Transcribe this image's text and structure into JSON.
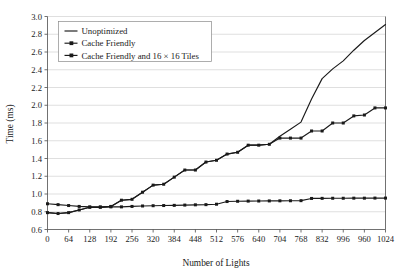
{
  "chart_data": {
    "type": "line",
    "title": "",
    "xlabel": "Number of Lights",
    "ylabel": "Time (ms)",
    "xlim": [
      0,
      1024
    ],
    "ylim": [
      0.6,
      3.0
    ],
    "grid": "horizontal",
    "legend_position": "top-left",
    "y_ticks": [
      "0.6",
      "0.8",
      "1.0",
      "1.2",
      "1.4",
      "1.6",
      "1.8",
      "2.0",
      "2.2",
      "2.4",
      "2.6",
      "2.8",
      "3.0"
    ],
    "y_tick_values": [
      0.6,
      0.8,
      1.0,
      1.2,
      1.4,
      1.6,
      1.8,
      2.0,
      2.2,
      2.4,
      2.6,
      2.8,
      3.0
    ],
    "x_ticks": [
      "0",
      "64",
      "128",
      "192",
      "256",
      "320",
      "384",
      "448",
      "512",
      "576",
      "640",
      "704",
      "768",
      "832",
      "996",
      "960",
      "1024"
    ],
    "x_tick_values": [
      0,
      64,
      128,
      192,
      256,
      320,
      384,
      448,
      512,
      576,
      640,
      704,
      768,
      832,
      896,
      960,
      1024
    ],
    "x": [
      0,
      32,
      64,
      96,
      128,
      160,
      192,
      224,
      256,
      288,
      320,
      352,
      384,
      416,
      448,
      480,
      512,
      544,
      576,
      608,
      640,
      672,
      704,
      736,
      768,
      800,
      832,
      864,
      896,
      928,
      960,
      992,
      1024
    ],
    "series": [
      {
        "name": "Unoptimized",
        "marker": "none",
        "color": "#1a1a1a",
        "values": [
          0.79,
          0.78,
          0.79,
          0.82,
          0.85,
          0.85,
          0.86,
          0.93,
          0.94,
          1.02,
          1.1,
          1.11,
          1.19,
          1.27,
          1.27,
          1.36,
          1.38,
          1.45,
          1.47,
          1.55,
          1.55,
          1.56,
          1.65,
          1.73,
          1.81,
          2.07,
          2.3,
          2.41,
          2.5,
          2.62,
          2.73,
          2.82,
          2.91
        ]
      },
      {
        "name": "Cache Friendly",
        "marker": "square",
        "color": "#1a1a1a",
        "values": [
          0.79,
          0.78,
          0.79,
          0.82,
          0.85,
          0.85,
          0.86,
          0.93,
          0.94,
          1.02,
          1.1,
          1.11,
          1.19,
          1.27,
          1.27,
          1.36,
          1.38,
          1.45,
          1.47,
          1.55,
          1.55,
          1.56,
          1.63,
          1.63,
          1.63,
          1.71,
          1.71,
          1.8,
          1.8,
          1.88,
          1.89,
          1.97,
          1.97
        ]
      },
      {
        "name": "Cache Friendly and 16 × 16 Tiles",
        "marker": "square",
        "color": "#1a1a1a",
        "values": [
          0.89,
          0.88,
          0.87,
          0.86,
          0.855,
          0.855,
          0.855,
          0.855,
          0.86,
          0.865,
          0.868,
          0.87,
          0.872,
          0.875,
          0.878,
          0.88,
          0.885,
          0.915,
          0.918,
          0.92,
          0.921,
          0.922,
          0.923,
          0.924,
          0.925,
          0.95,
          0.951,
          0.952,
          0.952,
          0.953,
          0.953,
          0.954,
          0.954
        ]
      }
    ]
  },
  "legend": {
    "items": [
      {
        "label": "Unoptimized"
      },
      {
        "label": "Cache Friendly"
      },
      {
        "label": "Cache Friendly and 16 × 16 Tiles"
      }
    ]
  }
}
